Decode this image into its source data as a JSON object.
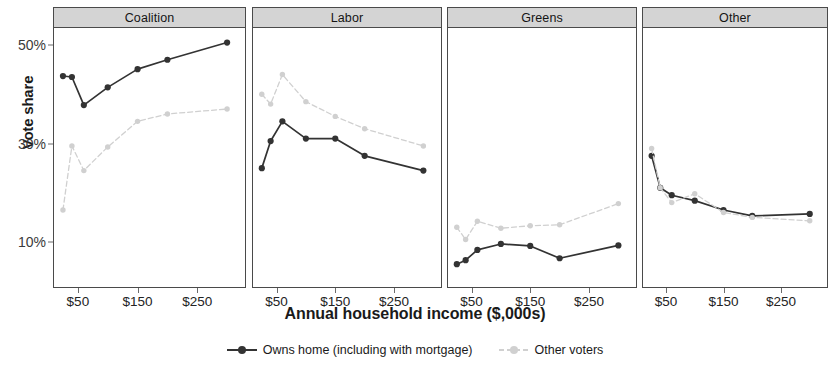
{
  "chart_data": {
    "type": "line",
    "title": "",
    "xlabel": "Annual household income ($,000s)",
    "ylabel": "Vote share",
    "facet_variable": "party",
    "facets": [
      "Coalition",
      "Labor",
      "Greens",
      "Other"
    ],
    "x": [
      25,
      40,
      60,
      100,
      150,
      200,
      300
    ],
    "xtick_values": [
      50,
      150,
      250
    ],
    "xtick_labels": [
      "$50",
      "$150",
      "$250"
    ],
    "xlim": [
      10,
      330
    ],
    "ytick_values": [
      10,
      30,
      50
    ],
    "ytick_labels": [
      "10%",
      "30%",
      "50%"
    ],
    "ylim": [
      2,
      54
    ],
    "grid": false,
    "legend_position": "bottom",
    "units": "percent",
    "series": [
      {
        "name": "Owns home (including with mortgage)",
        "color": "#333333",
        "linestyle": "solid",
        "marker": "circle-filled",
        "values_by_facet": {
          "Coalition": [
            43.7,
            43.5,
            37.8,
            41.4,
            45.1,
            47.0,
            50.5
          ],
          "Labor": [
            25.0,
            30.5,
            34.5,
            31.0,
            31.0,
            27.5,
            24.5
          ],
          "Greens": [
            5.5,
            6.3,
            8.4,
            9.6,
            9.2,
            6.7,
            9.3
          ],
          "Other": [
            27.5,
            21.0,
            19.5,
            18.4,
            16.5,
            15.3,
            15.7
          ]
        }
      },
      {
        "name": "Other voters",
        "color": "#d0d0d0",
        "linestyle": "dashed",
        "marker": "circle-filled",
        "values_by_facet": {
          "Coalition": [
            16.5,
            29.5,
            24.5,
            29.3,
            34.5,
            36.0,
            37.0
          ],
          "Labor": [
            40.0,
            38.0,
            44.0,
            38.5,
            35.5,
            33.0,
            29.5
          ],
          "Greens": [
            13.0,
            10.5,
            14.2,
            12.8,
            13.3,
            13.5,
            17.8
          ],
          "Other": [
            29.0,
            21.0,
            18.0,
            19.8,
            16.0,
            15.0,
            14.3
          ]
        }
      }
    ]
  },
  "axes": {
    "y_title": "Vote share",
    "x_title": "Annual household income ($,000s)",
    "y_ticks": [
      "50%",
      "30%",
      "10%"
    ],
    "x_ticks": [
      "$50",
      "$150",
      "$250"
    ]
  },
  "panels": [
    {
      "label": "Coalition"
    },
    {
      "label": "Labor"
    },
    {
      "label": "Greens"
    },
    {
      "label": "Other"
    }
  ],
  "legend": {
    "items": [
      {
        "label": "Owns home (including with mortgage)",
        "color": "#333333"
      },
      {
        "label": "Other voters",
        "color": "#d0d0d0"
      }
    ]
  }
}
